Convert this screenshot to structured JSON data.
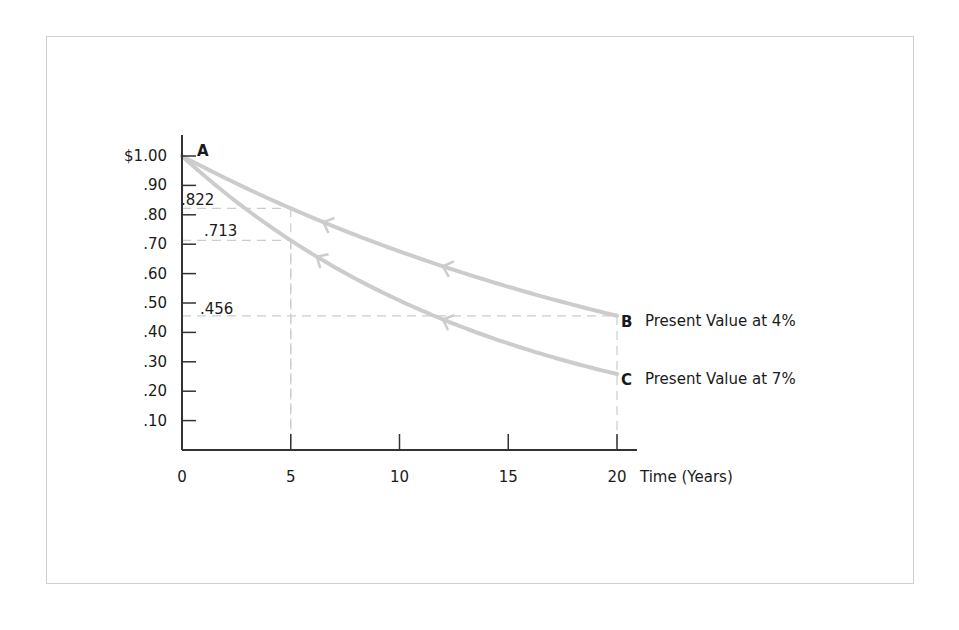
{
  "chart_data": {
    "type": "line",
    "title": "",
    "xlabel": "Time (Years)",
    "ylabel": "",
    "xlim": [
      0,
      20
    ],
    "ylim": [
      0,
      1.0
    ],
    "grid": false,
    "x_ticks": [
      0,
      5,
      10,
      15,
      20
    ],
    "x_tick_labels": [
      "0",
      "5",
      "10",
      "15",
      "20"
    ],
    "y_ticks": [
      0.1,
      0.2,
      0.3,
      0.4,
      0.5,
      0.6,
      0.7,
      0.8,
      0.9,
      1.0
    ],
    "y_tick_labels": [
      ".10",
      ".20",
      ".30",
      ".40",
      ".50",
      ".60",
      ".70",
      ".80",
      ".90",
      "$1.00"
    ],
    "series": [
      {
        "name": "Present Value at 4%",
        "end_label": "B",
        "rate": 0.04,
        "x": [
          0,
          5,
          10,
          15,
          20
        ],
        "values": [
          1.0,
          0.822,
          0.676,
          0.555,
          0.456
        ]
      },
      {
        "name": "Present Value at 7%",
        "end_label": "C",
        "rate": 0.07,
        "x": [
          0,
          5,
          10,
          15,
          20
        ],
        "values": [
          1.0,
          0.713,
          0.508,
          0.362,
          0.258
        ]
      }
    ],
    "start_point_label": "A",
    "annotations": [
      {
        "text": ".822",
        "x": 5,
        "y": 0.822,
        "guide": "dashed"
      },
      {
        "text": ".713",
        "x": 5,
        "y": 0.713,
        "guide": "dashed"
      },
      {
        "text": ".456",
        "x": 20,
        "y": 0.456,
        "guide": "dashed"
      }
    ],
    "colors": {
      "curve": "#cccccc",
      "axis": "#333333",
      "guide": "#cccccc",
      "frame": "#cfcfcf",
      "text": "#1a1a1a"
    }
  }
}
